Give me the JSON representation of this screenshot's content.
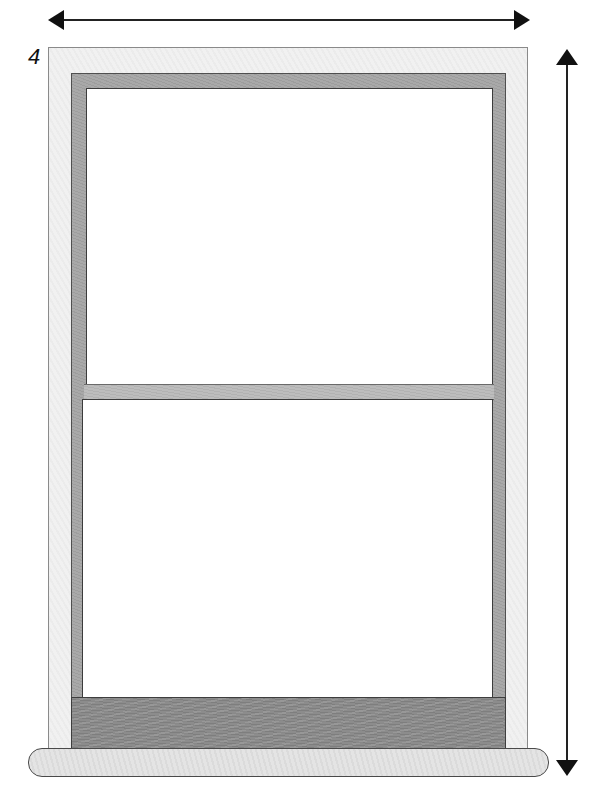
{
  "figure": {
    "step_label": "4",
    "measurements": {
      "width_arrow": "horizontal double-headed arrow spanning window width",
      "height_arrow": "vertical double-headed arrow spanning window height"
    },
    "parts": {
      "outer_frame": "casing",
      "sash": "sash frame",
      "upper_pane": "upper glass pane",
      "meeting_rail": "meeting rail",
      "lower_pane": "lower glass pane",
      "bottom_rail": "bottom rail",
      "sill": "window sill"
    },
    "colors": {
      "casing": "#f1f1f1",
      "sash": "#a9a9a9",
      "meeting_rail": "#bdbdbd",
      "bottom_rail": "#8c8c8c",
      "sill": "#e4e4e4",
      "glass": "#ffffff",
      "arrow": "#111111"
    }
  }
}
